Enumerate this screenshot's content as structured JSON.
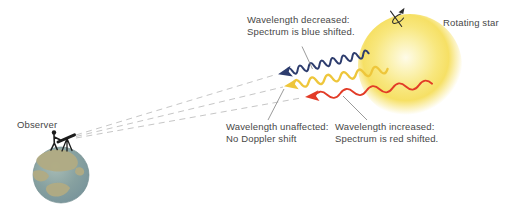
{
  "labels": {
    "blue_shift_line1": "Wavelength decreased:",
    "blue_shift_line2": "Spectrum is blue shifted.",
    "rotating_star": "Rotating star",
    "observer": "Observer",
    "no_shift_line1": "Wavelength unaffected:",
    "no_shift_line2": "No Doppler shift",
    "red_shift_line1": "Wavelength increased:",
    "red_shift_line2": "Spectrum is red shifted."
  },
  "icons": {
    "rotation_axis": "rotation-axis-icon",
    "observer_telescope": "observer-telescope-icon",
    "blue_arrow": "blue-shift-wave-arrow",
    "yellow_arrow": "no-shift-wave-arrow",
    "red_arrow": "red-shift-wave-arrow"
  },
  "colors": {
    "background": "#ffffff",
    "text": "#474747",
    "blue_wave": "#2e3d6e",
    "yellow_wave": "#eec63b",
    "red_wave": "#e23b27",
    "star_core": "#fefbe8",
    "star_glow": "#f6e065",
    "dashed_sightline": "#c6c6c6",
    "leader_line": "#8f8f8f",
    "silhouette": "#1c1c1c",
    "ocean": "#87a1a0",
    "land": "#b1ab83"
  }
}
